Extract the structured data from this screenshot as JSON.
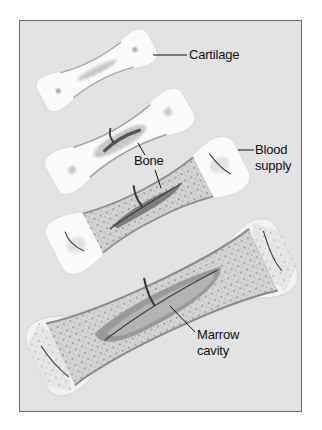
{
  "diagram": {
    "stages": [
      {
        "name": "stage-1-cartilage-model"
      },
      {
        "name": "stage-2-primary-ossification"
      },
      {
        "name": "stage-3-blood-vessel-invasion"
      },
      {
        "name": "stage-4-marrow-cavity-formed"
      }
    ],
    "labels": {
      "cartilage": "Cartilage",
      "bone": "Bone",
      "blood_supply_line1": "Blood",
      "blood_supply_line2": "supply",
      "marrow_line1": "Marrow",
      "marrow_line2": "cavity"
    },
    "colors": {
      "background": "#e3e3e3",
      "frame": "#6a6a6a",
      "cartilage": "#fafafa",
      "bone_tissue": "#c9c9c9",
      "marrow": "#8a8a8a",
      "vessel": "#3a3a3a",
      "leader_line": "#111111"
    }
  }
}
